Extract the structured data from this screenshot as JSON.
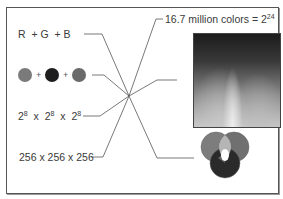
{
  "diagram": {
    "left_labels": {
      "rgb": {
        "r": "R",
        "plus1": "+",
        "g": "G",
        "plus2": "+",
        "b": "B"
      },
      "swatches": {
        "colors": [
          "#7a7a7a",
          "#1e1e1e",
          "#6a6a6a"
        ],
        "plus": "+"
      },
      "powers": {
        "base": "2",
        "exp": "8",
        "times": "x"
      },
      "decimal": "256 x 256 x 256"
    },
    "right_labels": {
      "total_text": "16.7 million colors = 2",
      "total_exp": "24",
      "photo_desc": "grayscale spectrum image",
      "venn_desc": "additive RGB overlapping circles"
    },
    "colors": {
      "frame": "#555555",
      "line": "#555555",
      "venn_red": "#7d7d7d",
      "venn_green": "#707070",
      "venn_blue": "#2a2a2a"
    }
  }
}
